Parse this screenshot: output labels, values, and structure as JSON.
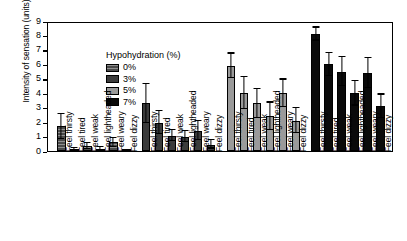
{
  "chart_data": {
    "type": "bar",
    "title": "",
    "xlabel": "",
    "ylabel": "Intensity of sensation (units)",
    "ylim": [
      0,
      9
    ],
    "yticks": [
      0,
      1,
      2,
      3,
      4,
      5,
      6,
      7,
      8,
      9
    ],
    "grid": false,
    "legend_title": "Hypohydration (%)",
    "legend_position": "top-left inside plot",
    "categories": [
      "Feel thirsty",
      "Feel tired",
      "Feel weak",
      "Feel lightheaded",
      "Feel weary",
      "Feel dizzy"
    ],
    "series": [
      {
        "name": "0%",
        "color": "#4a4a4a",
        "pattern": "hatched",
        "values": [
          1.7,
          0.1,
          0.35,
          0.15,
          0.6,
          0.03
        ],
        "errors": [
          0.85,
          0.08,
          0.2,
          0.12,
          0.32,
          0.03
        ]
      },
      {
        "name": "3%",
        "color": "#3b3b3b",
        "pattern": "solid",
        "values": [
          3.3,
          1.95,
          1.05,
          1.0,
          1.4,
          0.45
        ],
        "errors": [
          1.35,
          0.8,
          0.38,
          0.4,
          0.65,
          0.28
        ]
      },
      {
        "name": "5%",
        "color": "#9a9a9a",
        "pattern": "solid",
        "values": [
          5.9,
          4.0,
          3.3,
          2.4,
          4.0,
          2.1
        ],
        "errors": [
          0.85,
          1.1,
          1.0,
          0.95,
          0.95,
          0.85
        ]
      },
      {
        "name": "7%",
        "color": "#0a0a0a",
        "pattern": "solid",
        "values": [
          8.1,
          6.0,
          5.5,
          4.0,
          5.4,
          3.1
        ],
        "errors": [
          0.45,
          0.8,
          1.0,
          0.85,
          1.05,
          0.8
        ]
      }
    ]
  },
  "axis": {
    "y_title": "Intensity of sensation (units)",
    "y_tick_labels": [
      "9",
      "8",
      "7",
      "6",
      "5",
      "4",
      "3",
      "2",
      "1",
      "0"
    ]
  },
  "legend": {
    "title": "Hypohydration (%)",
    "items": [
      {
        "label": "0%"
      },
      {
        "label": "3%"
      },
      {
        "label": "5%"
      },
      {
        "label": "7%"
      }
    ]
  }
}
